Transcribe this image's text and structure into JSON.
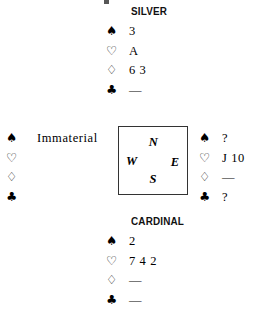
{
  "diagram": {
    "type": "bridge-hand-diagram",
    "suit_symbols": {
      "spade": "♠",
      "heart": "♡",
      "diamond": "♢",
      "club": "♣"
    },
    "void_marker": "—",
    "compass": {
      "north": "N",
      "west": "W",
      "east": "E",
      "south": "S"
    },
    "hands": {
      "north": {
        "name": "SILVER",
        "spades": "3",
        "hearts": "A",
        "diamonds": "6 3",
        "clubs": "—"
      },
      "south": {
        "name": "CARDINAL",
        "spades": "2",
        "hearts": "7 4 2",
        "diamonds": "—",
        "clubs": "—"
      },
      "west": {
        "name": "",
        "spades": "Immaterial",
        "hearts": "",
        "diamonds": "",
        "clubs": ""
      },
      "east": {
        "name": "",
        "spades": "?",
        "hearts": "J 10",
        "diamonds": "—",
        "clubs": "?"
      }
    }
  }
}
